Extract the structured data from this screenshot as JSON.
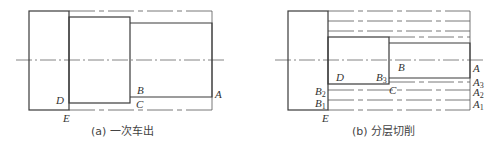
{
  "diagram_a": {
    "caption": "(a) 一次车出",
    "labels": {
      "A": "A",
      "B": "B",
      "C": "C",
      "D": "D",
      "E": "E"
    }
  },
  "diagram_b": {
    "caption": "(b) 分层切削",
    "labels": {
      "A": "A",
      "A1": "A",
      "A1_sub": "1",
      "A2": "A",
      "A2_sub": "2",
      "A3": "A",
      "A3_sub": "3",
      "B": "B",
      "B1": "B",
      "B1_sub": "1",
      "B2": "B",
      "B2_sub": "2",
      "B3": "B",
      "B3_sub": "3",
      "C": "C",
      "D": "D",
      "E": "E"
    }
  },
  "colors": {
    "line": "#3a3a3a",
    "dashed": "#555555",
    "text": "#333333"
  }
}
